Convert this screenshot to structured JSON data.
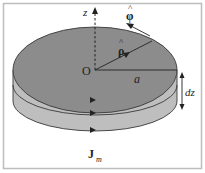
{
  "figure": {
    "labels": {
      "z_axis": "z",
      "phi_hat": "φ",
      "phi_hat_accent": "^",
      "rho_hat": "ρ",
      "rho_hat_accent": "^",
      "origin": "O",
      "radius": "a",
      "thickness": "dz",
      "current_main": "J",
      "current_sub": "m"
    },
    "colors": {
      "top_face": "#8c8c8c",
      "side_face": "#bebebe",
      "outline": "#3a3a3a",
      "frame": "#bdbdbd"
    }
  }
}
